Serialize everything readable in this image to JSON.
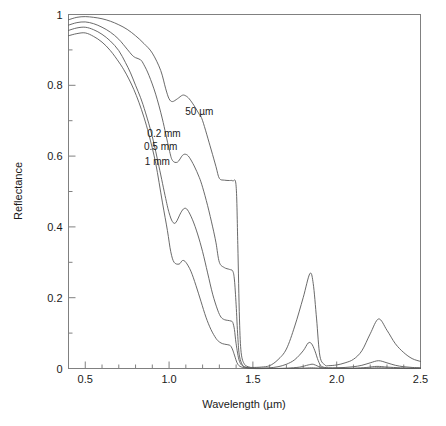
{
  "chart_data": {
    "type": "line",
    "title": "",
    "xlabel": "Wavelength (µm)",
    "ylabel": "Reflectance",
    "xlim": [
      0.4,
      2.5
    ],
    "ylim": [
      0,
      1
    ],
    "grid": false,
    "legend_position": "inline-annotations",
    "x_major_ticks": [
      0.5,
      1.0,
      1.5,
      2.0,
      2.5
    ],
    "x_major_tick_labels": [
      "0.5",
      "1.0",
      "1.5",
      "2.0",
      "2.5"
    ],
    "x_minor_tick_step": 0.1,
    "y_major_ticks": [
      0,
      0.2,
      0.4,
      0.6,
      0.8,
      1
    ],
    "y_major_tick_labels": [
      "0",
      "0.2",
      "0.4",
      "0.6",
      "0.8",
      "1"
    ],
    "y_minor_tick_step": 0.1,
    "annotations": [
      {
        "text": "50 µm",
        "x": 1.18,
        "y": 0.715
      },
      {
        "text": "0.2 mm",
        "x": 0.97,
        "y": 0.655
      },
      {
        "text": "0.5 mm",
        "x": 0.95,
        "y": 0.617
      },
      {
        "text": "1 mm",
        "x": 0.93,
        "y": 0.575
      }
    ],
    "series": [
      {
        "name": "50 µm",
        "x": [
          0.4,
          0.45,
          0.5,
          0.55,
          0.6,
          0.65,
          0.7,
          0.75,
          0.8,
          0.85,
          0.9,
          0.95,
          0.98,
          1.0,
          1.02,
          1.05,
          1.08,
          1.1,
          1.12,
          1.15,
          1.18,
          1.2,
          1.25,
          1.28,
          1.3,
          1.33,
          1.36,
          1.38,
          1.4,
          1.41,
          1.42,
          1.43,
          1.45,
          1.48,
          1.5,
          1.55,
          1.6,
          1.65,
          1.7,
          1.75,
          1.8,
          1.84,
          1.86,
          1.88,
          1.9,
          1.93,
          1.95,
          2.0,
          2.05,
          2.1,
          2.15,
          2.2,
          2.25,
          2.3,
          2.35,
          2.4,
          2.45,
          2.5
        ],
        "y": [
          0.985,
          0.992,
          0.994,
          0.992,
          0.988,
          0.981,
          0.971,
          0.958,
          0.94,
          0.918,
          0.891,
          0.842,
          0.79,
          0.762,
          0.754,
          0.762,
          0.772,
          0.77,
          0.762,
          0.742,
          0.718,
          0.7,
          0.62,
          0.57,
          0.537,
          0.532,
          0.531,
          0.53,
          0.515,
          0.35,
          0.14,
          0.045,
          0.012,
          0.004,
          0.003,
          0.004,
          0.008,
          0.025,
          0.055,
          0.12,
          0.2,
          0.268,
          0.24,
          0.14,
          0.035,
          0.01,
          0.008,
          0.01,
          0.016,
          0.026,
          0.05,
          0.098,
          0.14,
          0.108,
          0.07,
          0.045,
          0.028,
          0.02
        ]
      },
      {
        "name": "0.2 mm",
        "x": [
          0.4,
          0.45,
          0.5,
          0.55,
          0.6,
          0.65,
          0.7,
          0.75,
          0.78,
          0.8,
          0.83,
          0.85,
          0.88,
          0.92,
          0.96,
          1.0,
          1.02,
          1.05,
          1.08,
          1.1,
          1.12,
          1.15,
          1.18,
          1.2,
          1.23,
          1.26,
          1.28,
          1.3,
          1.33,
          1.36,
          1.38,
          1.39,
          1.4,
          1.41,
          1.42,
          1.44,
          1.46,
          1.5,
          1.55,
          1.6,
          1.65,
          1.7,
          1.75,
          1.8,
          1.83,
          1.85,
          1.87,
          1.89,
          1.91,
          1.95,
          2.0,
          2.05,
          2.1,
          2.15,
          2.2,
          2.25,
          2.3,
          2.35,
          2.4,
          2.45,
          2.5
        ],
        "y": [
          0.97,
          0.977,
          0.979,
          0.974,
          0.964,
          0.95,
          0.93,
          0.902,
          0.885,
          0.878,
          0.872,
          0.858,
          0.828,
          0.775,
          0.705,
          0.62,
          0.588,
          0.583,
          0.602,
          0.605,
          0.597,
          0.572,
          0.54,
          0.512,
          0.46,
          0.4,
          0.355,
          0.3,
          0.285,
          0.28,
          0.275,
          0.25,
          0.18,
          0.09,
          0.035,
          0.008,
          0.003,
          0.001,
          0.001,
          0.002,
          0.005,
          0.012,
          0.025,
          0.05,
          0.072,
          0.07,
          0.05,
          0.022,
          0.006,
          0.002,
          0.002,
          0.003,
          0.005,
          0.009,
          0.016,
          0.022,
          0.016,
          0.009,
          0.005,
          0.003,
          0.002
        ]
      },
      {
        "name": "0.5 mm",
        "x": [
          0.4,
          0.45,
          0.5,
          0.55,
          0.6,
          0.65,
          0.7,
          0.74,
          0.77,
          0.8,
          0.83,
          0.86,
          0.9,
          0.94,
          0.98,
          1.0,
          1.02,
          1.04,
          1.07,
          1.09,
          1.11,
          1.14,
          1.17,
          1.2,
          1.23,
          1.26,
          1.29,
          1.31,
          1.33,
          1.35,
          1.37,
          1.38,
          1.39,
          1.4,
          1.42,
          1.45,
          1.5,
          1.6,
          1.7,
          1.78,
          1.83,
          1.86,
          1.89,
          1.93,
          2.0,
          2.1,
          2.18,
          2.24,
          2.3,
          2.38,
          2.45,
          2.5
        ],
        "y": [
          0.955,
          0.962,
          0.964,
          0.957,
          0.944,
          0.925,
          0.898,
          0.864,
          0.835,
          0.8,
          0.765,
          0.722,
          0.655,
          0.57,
          0.48,
          0.44,
          0.415,
          0.412,
          0.44,
          0.452,
          0.448,
          0.42,
          0.38,
          0.33,
          0.27,
          0.21,
          0.165,
          0.145,
          0.138,
          0.136,
          0.134,
          0.13,
          0.11,
          0.07,
          0.02,
          0.005,
          0.001,
          0.0,
          0.001,
          0.004,
          0.01,
          0.012,
          0.006,
          0.001,
          0.001,
          0.001,
          0.003,
          0.006,
          0.004,
          0.002,
          0.001,
          0.001
        ]
      },
      {
        "name": "1 mm",
        "x": [
          0.4,
          0.45,
          0.5,
          0.55,
          0.6,
          0.65,
          0.7,
          0.73,
          0.76,
          0.79,
          0.82,
          0.85,
          0.88,
          0.92,
          0.96,
          0.99,
          1.01,
          1.03,
          1.06,
          1.08,
          1.1,
          1.13,
          1.16,
          1.19,
          1.22,
          1.25,
          1.28,
          1.3,
          1.32,
          1.34,
          1.36,
          1.37,
          1.38,
          1.39,
          1.41,
          1.44,
          1.5,
          1.6,
          1.7,
          1.8,
          1.85,
          1.9,
          2.0,
          2.1,
          2.2,
          2.25,
          2.32,
          2.4,
          2.5
        ],
        "y": [
          0.94,
          0.946,
          0.948,
          0.938,
          0.922,
          0.898,
          0.866,
          0.844,
          0.818,
          0.788,
          0.752,
          0.71,
          0.66,
          0.58,
          0.47,
          0.39,
          0.33,
          0.3,
          0.295,
          0.305,
          0.3,
          0.275,
          0.235,
          0.19,
          0.145,
          0.11,
          0.085,
          0.075,
          0.07,
          0.068,
          0.066,
          0.062,
          0.052,
          0.038,
          0.012,
          0.003,
          0.0,
          0.0,
          0.0,
          0.001,
          0.002,
          0.001,
          0.0,
          0.0,
          0.001,
          0.002,
          0.001,
          0.0,
          0.0
        ]
      }
    ]
  },
  "axes": {
    "x_title": "Wavelength (µm)",
    "y_title": "Reflectance"
  },
  "colors": {
    "curve": "#595959",
    "frame": "#808080",
    "text": "#1a1a1a",
    "background": "#ffffff"
  }
}
